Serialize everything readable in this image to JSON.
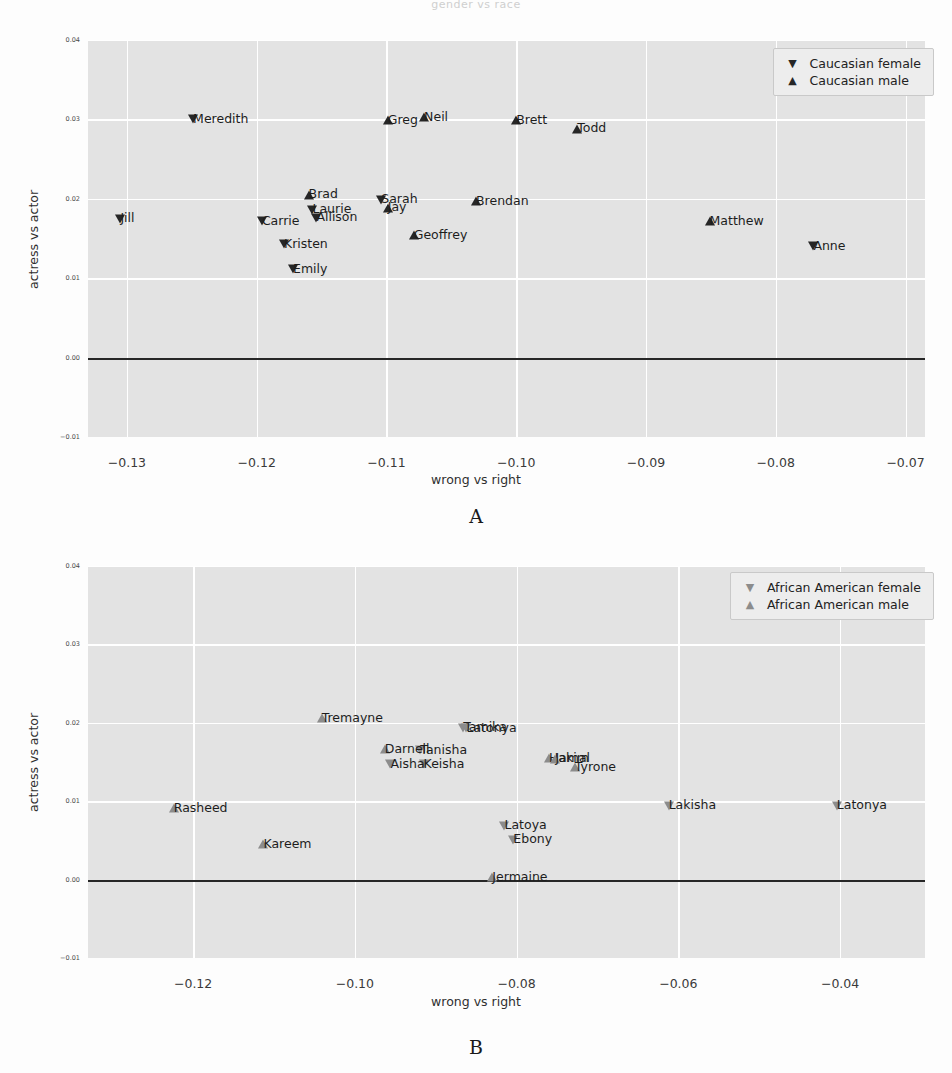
{
  "top_title": "gender vs race",
  "panels": [
    {
      "letter": "A",
      "axis": {
        "xlabel": "wrong vs  right",
        "ylabel": "actress vs actor"
      },
      "xticks": [
        "-0.13",
        "-0.12",
        "-0.11",
        "-0.10",
        "-0.09",
        "-0.08",
        "-0.07"
      ],
      "yticks": [
        "0.04",
        "0.03",
        "0.02",
        "0.01",
        "0.00",
        "-0.01"
      ],
      "legend": [
        {
          "marker": "down-triangle",
          "label": "Caucasian female"
        },
        {
          "marker": "up-triangle",
          "label": "Caucasian male"
        }
      ],
      "marker_color": "#262626"
    },
    {
      "letter": "B",
      "axis": {
        "xlabel": "wrong vs  right",
        "ylabel": "actress vs actor"
      },
      "xticks": [
        "-0.12",
        "-0.10",
        "-0.08",
        "-0.06",
        "-0.04"
      ],
      "yticks": [
        "0.04",
        "0.03",
        "0.02",
        "0.01",
        "0.00",
        "-0.01"
      ],
      "legend": [
        {
          "marker": "down-triangle",
          "label": "African American female"
        },
        {
          "marker": "up-triangle",
          "label": "African American male"
        }
      ],
      "marker_color": "#8c8c8c"
    }
  ],
  "chart_data": [
    {
      "type": "scatter",
      "title": "A",
      "xlabel": "wrong vs  right",
      "ylabel": "actress vs actor",
      "xlim": [
        -0.133,
        -0.0685
      ],
      "ylim": [
        -0.01,
        0.04
      ],
      "grid": true,
      "legend_position": "upper right",
      "reference_line": {
        "y": 0.0,
        "color": "#262626"
      },
      "series": [
        {
          "name": "Caucasian female",
          "marker": "down-triangle",
          "color": "#262626",
          "points": [
            {
              "label": "Meredith",
              "x": -0.1249,
              "y": 0.03,
              "side": "right"
            },
            {
              "label": "Jill",
              "x": -0.1305,
              "y": 0.0175,
              "side": "right"
            },
            {
              "label": "Carrie",
              "x": -0.1196,
              "y": 0.0172,
              "side": "right"
            },
            {
              "label": "Laurie",
              "x": -0.1157,
              "y": 0.0186,
              "side": "right"
            },
            {
              "label": "Allison",
              "x": -0.1154,
              "y": 0.0176,
              "side": "right"
            },
            {
              "label": "Sarah",
              "x": -0.1104,
              "y": 0.0199,
              "side": "right"
            },
            {
              "label": "Kristen",
              "x": -0.1179,
              "y": 0.0143,
              "side": "right"
            },
            {
              "label": "Emily",
              "x": -0.1172,
              "y": 0.0111,
              "side": "right"
            },
            {
              "label": "Anne",
              "x": -0.0771,
              "y": 0.014,
              "side": "right"
            }
          ]
        },
        {
          "name": "Caucasian male",
          "marker": "up-triangle",
          "color": "#262626",
          "points": [
            {
              "label": "Greg",
              "x": -0.1099,
              "y": 0.0299,
              "side": "right"
            },
            {
              "label": "Neil",
              "x": -0.1071,
              "y": 0.0303,
              "side": "right"
            },
            {
              "label": "Brett",
              "x": -0.1,
              "y": 0.0299,
              "side": "right"
            },
            {
              "label": "Todd",
              "x": -0.0953,
              "y": 0.0288,
              "side": "right"
            },
            {
              "label": "Brad",
              "x": -0.116,
              "y": 0.0205,
              "side": "right"
            },
            {
              "label": "Jay",
              "x": -0.1099,
              "y": 0.0189,
              "side": "right"
            },
            {
              "label": "Brendan",
              "x": -0.1031,
              "y": 0.0197,
              "side": "right"
            },
            {
              "label": "Geoffrey",
              "x": -0.1079,
              "y": 0.0154,
              "side": "right"
            },
            {
              "label": "Matthew",
              "x": -0.0851,
              "y": 0.0172,
              "side": "right"
            }
          ]
        }
      ]
    },
    {
      "type": "scatter",
      "title": "B",
      "xlabel": "wrong vs  right",
      "ylabel": "actress vs actor",
      "xlim": [
        -0.133,
        -0.0295
      ],
      "ylim": [
        -0.01,
        0.04
      ],
      "grid": true,
      "legend_position": "upper right",
      "reference_line": {
        "y": 0.0,
        "color": "#262626"
      },
      "series": [
        {
          "name": "African American female",
          "marker": "down-triangle",
          "color": "#8c8c8c",
          "points": [
            {
              "label": "Tamika",
              "x": -0.0866,
              "y": 0.0194,
              "side": "right"
            },
            {
              "label": "Latonya",
              "x": -0.0862,
              "y": 0.0193,
              "side": "right"
            },
            {
              "label": "Tanisha",
              "x": -0.0919,
              "y": 0.0165,
              "side": "right"
            },
            {
              "label": "Keisha",
              "x": -0.0915,
              "y": 0.0147,
              "side": "right"
            },
            {
              "label": "Aisha",
              "x": -0.0956,
              "y": 0.0147,
              "side": "right"
            },
            {
              "label": "Lakisha",
              "x": -0.0612,
              "y": 0.0094,
              "side": "right"
            },
            {
              "label": "Latonya",
              "x": -0.0404,
              "y": 0.0094,
              "side": "right"
            },
            {
              "label": "Latoya",
              "x": -0.0815,
              "y": 0.0069,
              "side": "right"
            },
            {
              "label": "Ebony",
              "x": -0.0804,
              "y": 0.0051,
              "side": "right"
            }
          ]
        },
        {
          "name": "African American male",
          "marker": "up-triangle",
          "color": "#8c8c8c",
          "points": [
            {
              "label": "Tremayne",
              "x": -0.1041,
              "y": 0.0206,
              "side": "right"
            },
            {
              "label": "Darnell",
              "x": -0.0963,
              "y": 0.0166,
              "side": "right"
            },
            {
              "label": "Hakim",
              "x": -0.076,
              "y": 0.0155,
              "side": "right"
            },
            {
              "label": "Jamal",
              "x": -0.0752,
              "y": 0.0154,
              "side": "right"
            },
            {
              "label": "Tyrone",
              "x": -0.0728,
              "y": 0.0143,
              "side": "right"
            },
            {
              "label": "Rasheed",
              "x": -0.1224,
              "y": 0.0091,
              "side": "right"
            },
            {
              "label": "Kareem",
              "x": -0.1113,
              "y": 0.0045,
              "side": "right"
            },
            {
              "label": "Jermaine",
              "x": -0.083,
              "y": 0.0003,
              "side": "right"
            }
          ]
        }
      ]
    }
  ]
}
